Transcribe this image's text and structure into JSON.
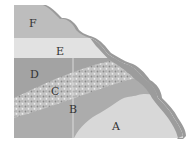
{
  "diagram": {
    "type": "geologic-cross-section",
    "layers": [
      {
        "id": "A",
        "label": "A",
        "color": "#d6d6d6",
        "x": 112,
        "y": 121
      },
      {
        "id": "B",
        "label": "B",
        "color": "#a9a9a9",
        "x": 69,
        "y": 104
      },
      {
        "id": "C",
        "label": "C",
        "color": "#c2c2c2",
        "x": 52,
        "y": 85
      },
      {
        "id": "D",
        "label": "D",
        "color": "#9f9f9f",
        "x": 30,
        "y": 70
      },
      {
        "id": "E",
        "label": "E",
        "color": "#e0e0e0",
        "x": 57,
        "y": 47
      },
      {
        "id": "F",
        "label": "F",
        "color": "#bcbcbc",
        "x": 31,
        "y": 22
      }
    ],
    "crust_color": "#8f8f8f",
    "crust_light_color": "#b0b0b0",
    "background": "#ffffff"
  }
}
